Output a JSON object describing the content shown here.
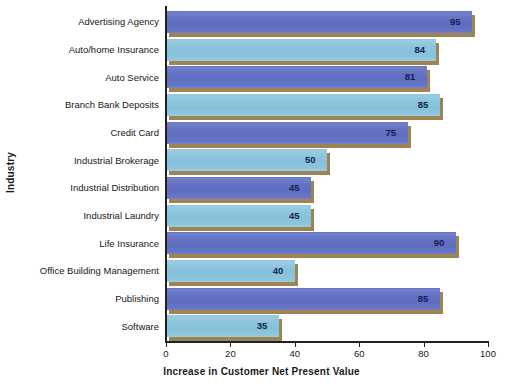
{
  "chart_data": {
    "type": "bar",
    "orientation": "horizontal",
    "title": "",
    "xlabel": "Increase in Customer Net Present Value",
    "ylabel": "Industry",
    "xlim": [
      0,
      100
    ],
    "xticks": [
      0,
      20,
      40,
      60,
      80,
      100
    ],
    "grid": false,
    "legend": null,
    "categories": [
      "Advertising Agency",
      "Auto/home Insurance",
      "Auto Service",
      "Branch Bank Deposits",
      "Credit Card",
      "Industrial Brokerage",
      "Industrial Distribution",
      "Industrial Laundry",
      "Life Insurance",
      "Office Building Management",
      "Publishing",
      "Software"
    ],
    "values": [
      95,
      84,
      81,
      85,
      75,
      50,
      45,
      45,
      90,
      40,
      85,
      35
    ],
    "value_labels": [
      "95",
      "84",
      "81",
      "85",
      "75",
      "50",
      "45",
      "45",
      "90",
      "40",
      "85",
      "35"
    ],
    "bar_styles": [
      "dark",
      "light",
      "dark",
      "light",
      "dark",
      "light",
      "dark",
      "light",
      "dark",
      "light",
      "dark",
      "light"
    ],
    "colors": {
      "bar_dark": "#6775c6",
      "bar_light": "#8ec6de",
      "bar_shadow": "#9d8452",
      "axis": "#202020",
      "value_label_text": "#14204f",
      "background": "#ffffff"
    }
  }
}
